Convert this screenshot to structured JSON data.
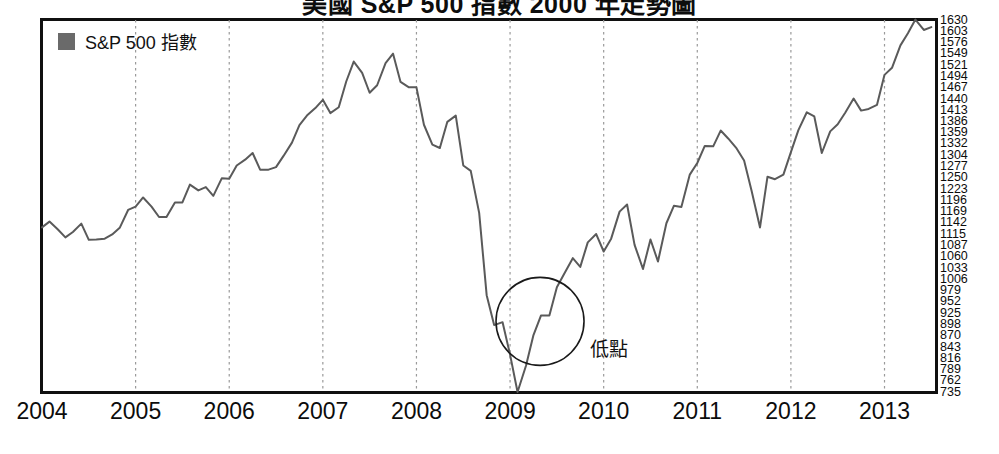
{
  "chart_data": {
    "type": "line",
    "title": "美國 S&P 500 指數 2000 年走勢圖",
    "xlabel": "",
    "ylabel": "",
    "legend": [
      {
        "name": "S&P 500 指數",
        "color": "#6a6a6a",
        "marker": "square"
      }
    ],
    "legend_position": "top-left",
    "grid": true,
    "grid_style": "vertical dotted at each year tick",
    "xlim": [
      2004.0,
      2013.55
    ],
    "ylim": [
      735,
      1630
    ],
    "x_tick_labels": [
      "2004",
      "2005",
      "2006",
      "2007",
      "2008",
      "2009",
      "2010",
      "2011",
      "2012",
      "2013"
    ],
    "x_tick_values": [
      2004,
      2005,
      2006,
      2007,
      2008,
      2009,
      2010,
      2011,
      2012,
      2013
    ],
    "y_tick_labels": [
      "1630",
      "1603",
      "1576",
      "1549",
      "1521",
      "1494",
      "1467",
      "1440",
      "1413",
      "1386",
      "1359",
      "1332",
      "1304",
      "1277",
      "1250",
      "1223",
      "1196",
      "1169",
      "1142",
      "1115",
      "1087",
      "1060",
      "1033",
      "1006",
      "979",
      "952",
      "925",
      "898",
      "870",
      "843",
      "816",
      "789",
      "762",
      "735"
    ],
    "y_tick_values": [
      1630,
      1603,
      1576,
      1549,
      1521,
      1494,
      1467,
      1440,
      1413,
      1386,
      1359,
      1332,
      1304,
      1277,
      1250,
      1223,
      1196,
      1169,
      1142,
      1115,
      1087,
      1060,
      1033,
      1006,
      979,
      952,
      925,
      898,
      870,
      843,
      816,
      789,
      762,
      735
    ],
    "series": [
      {
        "name": "S&P 500 指數",
        "color": "#5a5a5a",
        "x": [
          2004.0,
          2004.08,
          2004.17,
          2004.25,
          2004.33,
          2004.42,
          2004.5,
          2004.58,
          2004.67,
          2004.75,
          2004.83,
          2004.92,
          2005.0,
          2005.08,
          2005.17,
          2005.25,
          2005.33,
          2005.42,
          2005.5,
          2005.58,
          2005.67,
          2005.75,
          2005.83,
          2005.92,
          2006.0,
          2006.08,
          2006.17,
          2006.25,
          2006.33,
          2006.42,
          2006.5,
          2006.58,
          2006.67,
          2006.75,
          2006.83,
          2006.92,
          2007.0,
          2007.08,
          2007.17,
          2007.25,
          2007.33,
          2007.42,
          2007.5,
          2007.58,
          2007.67,
          2007.75,
          2007.83,
          2007.92,
          2008.0,
          2008.08,
          2008.17,
          2008.25,
          2008.33,
          2008.42,
          2008.5,
          2008.58,
          2008.67,
          2008.75,
          2008.83,
          2008.92,
          2009.0,
          2009.08,
          2009.17,
          2009.25,
          2009.33,
          2009.42,
          2009.5,
          2009.58,
          2009.67,
          2009.75,
          2009.83,
          2009.92,
          2010.0,
          2010.08,
          2010.17,
          2010.25,
          2010.33,
          2010.42,
          2010.5,
          2010.58,
          2010.67,
          2010.75,
          2010.83,
          2010.92,
          2011.0,
          2011.08,
          2011.17,
          2011.25,
          2011.33,
          2011.42,
          2011.5,
          2011.58,
          2011.67,
          2011.75,
          2011.83,
          2011.92,
          2012.0,
          2012.08,
          2012.17,
          2012.25,
          2012.33,
          2012.42,
          2012.5,
          2012.58,
          2012.67,
          2012.75,
          2012.83,
          2012.92,
          2013.0,
          2013.08,
          2013.17,
          2013.25,
          2013.33,
          2013.42,
          2013.5
        ],
        "y": [
          1131,
          1145,
          1126,
          1107,
          1120,
          1140,
          1101,
          1102,
          1104,
          1114,
          1130,
          1173,
          1181,
          1203,
          1181,
          1156,
          1156,
          1191,
          1191,
          1234,
          1220,
          1228,
          1207,
          1249,
          1248,
          1280,
          1294,
          1310,
          1270,
          1270,
          1276,
          1303,
          1335,
          1377,
          1400,
          1418,
          1438,
          1406,
          1420,
          1482,
          1530,
          1503,
          1455,
          1473,
          1526,
          1549,
          1481,
          1468,
          1468,
          1378,
          1330,
          1322,
          1385,
          1400,
          1280,
          1267,
          1166,
          968,
          896,
          903,
          825,
          735,
          798,
          872,
          919,
          919,
          987,
          1020,
          1057,
          1036,
          1095,
          1115,
          1073,
          1104,
          1169,
          1186,
          1089,
          1031,
          1102,
          1049,
          1141,
          1183,
          1180,
          1258,
          1286,
          1327,
          1326,
          1364,
          1345,
          1321,
          1292,
          1219,
          1131,
          1253,
          1247,
          1258,
          1312,
          1365,
          1408,
          1398,
          1310,
          1362,
          1379,
          1407,
          1441,
          1412,
          1416,
          1426,
          1498,
          1515,
          1569,
          1598,
          1631,
          1606,
          1613
        ]
      }
    ],
    "annotations": [
      {
        "type": "ellipse",
        "label": "",
        "center_x": 2009.32,
        "center_y": 905,
        "radius_px": 44
      },
      {
        "type": "text",
        "label": "低點",
        "x": 2009.85,
        "y": 845
      }
    ]
  },
  "legend": {
    "label": "S&P 500 指數"
  },
  "annotation": {
    "low_point": "低點"
  },
  "title": {
    "text": "美國 S&P 500 指數 2000 年走勢圖"
  }
}
